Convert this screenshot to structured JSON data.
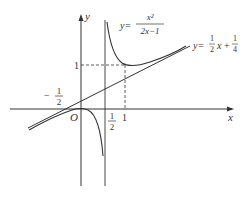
{
  "figure": {
    "axes": {
      "x_label": "x",
      "y_label": "y",
      "origin_label": "O"
    },
    "curve": {
      "label_prefix": "y=",
      "numerator": "x²",
      "denominator": "2x−1",
      "equation": "y = x^2/(2x-1)"
    },
    "asymptote_line": {
      "label_prefix": "y=",
      "slope_num": "1",
      "slope_den": "2",
      "var": "x",
      "plus": "+",
      "const_num": "1",
      "const_den": "4",
      "equation": "y = (1/2)x + 1/4"
    },
    "ticks": {
      "y_one": "1",
      "x_one": "1",
      "x_half_num": "1",
      "x_half_den": "2",
      "neg_half_sign": "−",
      "neg_half_num": "1",
      "neg_half_den": "2"
    },
    "colors": {
      "stroke": "#333333",
      "background": "#ffffff"
    }
  }
}
